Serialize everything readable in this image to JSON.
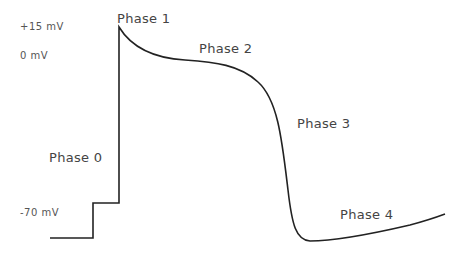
{
  "diagram": {
    "axis_labels": {
      "plus15": "+15  mV",
      "zero": "0  mV",
      "minus70": "-70  mV"
    },
    "phases": [
      {
        "id": 0,
        "label": "Phase  0"
      },
      {
        "id": 1,
        "label": "Phase  1"
      },
      {
        "id": 2,
        "label": "Phase  2"
      },
      {
        "id": 3,
        "label": "Phase  3"
      },
      {
        "id": 4,
        "label": "Phase  4"
      }
    ],
    "line_color": "#222222"
  }
}
